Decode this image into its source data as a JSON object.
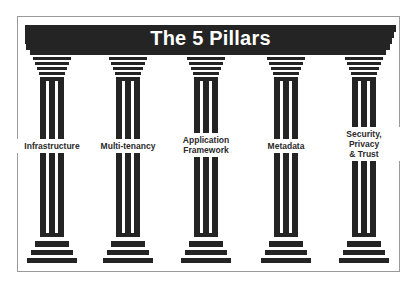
{
  "title": "The 5 Pillars",
  "colors": {
    "ink": "#242424",
    "frame": "#9a9a9a",
    "background": "#ffffff",
    "title_text": "#ffffff"
  },
  "pillars": [
    {
      "label_lines": [
        "Infrastructure"
      ],
      "label": "Infrastructure"
    },
    {
      "label_lines": [
        "Multi-tenancy"
      ],
      "label": "Multi-tenancy"
    },
    {
      "label_lines": [
        "Application",
        "Framework"
      ],
      "label": "Application Framework"
    },
    {
      "label_lines": [
        "Metadata"
      ],
      "label": "Metadata"
    },
    {
      "label_lines": [
        "Security,",
        "Privacy",
        "& Trust"
      ],
      "label": "Security, Privacy & Trust"
    }
  ]
}
